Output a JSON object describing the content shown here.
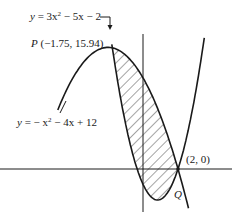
{
  "figure": {
    "labels": {
      "upper_parabola_eq": {
        "y": "y",
        "eq": " = 3x",
        "exp": "2",
        "rest": " − 5x − 2"
      },
      "lower_parabola_eq": {
        "y": "y",
        "eq": " = − x",
        "exp": "2",
        "rest": " − 4x + 12"
      },
      "point_p": {
        "name": "P",
        "coords": " (−1.75, 15.94)"
      },
      "point_intersection": "(2, 0)",
      "point_q": "Q"
    },
    "curves": [
      {
        "name": "y = -x^2 - 4x + 12",
        "type": "parabola",
        "opens": "down",
        "vertex": [
          -2,
          16
        ]
      },
      {
        "name": "y = 3x^2 - 5x - 2",
        "type": "parabola",
        "opens": "up",
        "vertex": [
          0.8333,
          -4.0833
        ]
      }
    ],
    "intersections": [
      {
        "label": "P",
        "x": -1.75,
        "y": 15.94
      },
      {
        "label": "(2, 0)",
        "x": 2,
        "y": 0
      }
    ],
    "shaded_region": "area between the two parabolas from x = -1.75 to x = 2",
    "colors": {
      "ink": "#1a1a1a",
      "background": "#ffffff"
    }
  }
}
